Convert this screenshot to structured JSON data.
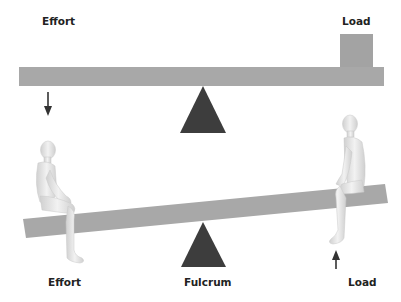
{
  "top_diagram": {
    "effort_label": "Effort",
    "load_label": "Load",
    "effort_arrow": "down-arrow",
    "beam": "horizontal-beam",
    "fulcrum": "triangle-fulcrum",
    "load_box": "load-block"
  },
  "bottom_diagram": {
    "effort_label": "Effort",
    "fulcrum_label": "Fulcrum",
    "load_label": "Load",
    "load_arrow": "up-arrow",
    "beam": "tilted-seesaw-beam",
    "left_figure": "seated-person",
    "right_figure": "seated-person"
  },
  "colors": {
    "beam": "#a8a8a8",
    "fulcrum": "#3d3d3d",
    "load_box": "#a3a3a3",
    "figure": "#e2e2e2",
    "arrow": "#333333",
    "text": "#222222"
  }
}
